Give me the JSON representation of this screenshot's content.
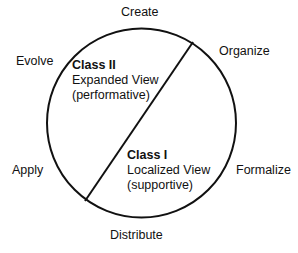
{
  "stages": {
    "create": "Create",
    "organize": "Organize",
    "formalize": "Formalize",
    "distribute": "Distribute",
    "apply": "Apply",
    "evolve": "Evolve"
  },
  "class2": {
    "title": "Class II",
    "line1": "Expanded View",
    "line2": "(performative)"
  },
  "class1": {
    "title": "Class I",
    "line1": "Localized View",
    "line2": "(supportive)"
  },
  "colors": {
    "stroke": "#111111",
    "background": "#ffffff"
  }
}
